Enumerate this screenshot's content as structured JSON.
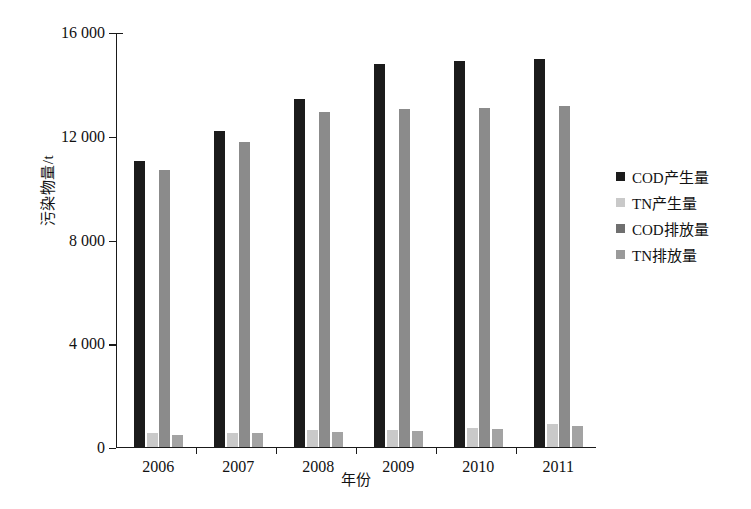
{
  "chart_data": {
    "type": "bar",
    "title": "",
    "xlabel": "年份",
    "ylabel": "污染物量/t",
    "categories": [
      "2006",
      "2007",
      "2008",
      "2009",
      "2010",
      "2011"
    ],
    "ylim": [
      0,
      16000
    ],
    "yticks": [
      0,
      4000,
      8000,
      12000,
      16000
    ],
    "ytick_labels": [
      "0",
      "4 000",
      "8 000",
      "12 000",
      "16 000"
    ],
    "grid": false,
    "legend_position": "right",
    "series": [
      {
        "name": "COD产生量",
        "color": "#1b1b1b",
        "values": [
          11000,
          12150,
          13400,
          14750,
          14850,
          14950
        ]
      },
      {
        "name": "TN产生量",
        "color": "#c9c9c9",
        "values": [
          520,
          540,
          640,
          660,
          730,
          860
        ]
      },
      {
        "name": "COD排放量",
        "color": "#8b8b8b",
        "values": [
          10650,
          11750,
          12900,
          13000,
          13050,
          13120
        ]
      },
      {
        "name": "TN排放量",
        "color": "#a3a3a3",
        "values": [
          430,
          520,
          560,
          600,
          680,
          800
        ]
      }
    ]
  },
  "axis": {
    "y_title": "污染物量/t",
    "x_title": "年份"
  },
  "legend": {
    "items": [
      {
        "label": "COD产生量",
        "color": "#1b1b1b"
      },
      {
        "label": "TN产生量",
        "color": "#c9c9c9"
      },
      {
        "label": "COD排放量",
        "color": "#6f6f6f"
      },
      {
        "label": "TN排放量",
        "color": "#9a9a9a"
      }
    ]
  },
  "caption": {
    "text": ""
  }
}
